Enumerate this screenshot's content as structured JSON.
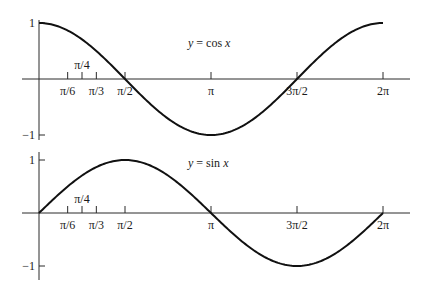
{
  "chart_data": [
    {
      "type": "line",
      "title": "",
      "function": "cos",
      "equation": {
        "y": "y",
        "eq": "=",
        "fn": "cos",
        "x": "x"
      },
      "xlabel": "",
      "ylabel": "",
      "xlim": [
        0,
        6.2832
      ],
      "ylim": [
        -1,
        1
      ],
      "grid": false,
      "x_ticks": [
        {
          "value": 0.5236,
          "label": "π/6",
          "above": false
        },
        {
          "value": 0.7854,
          "label": "π/4",
          "above": true
        },
        {
          "value": 1.0472,
          "label": "π/3",
          "above": false
        },
        {
          "value": 1.5708,
          "label": "π/2",
          "above": false
        },
        {
          "value": 3.1416,
          "label": "π",
          "above": false
        },
        {
          "value": 4.7124,
          "label": "3π/2",
          "above": false
        },
        {
          "value": 6.2832,
          "label": "2π",
          "above": false
        }
      ],
      "y_ticks": [
        {
          "value": 1,
          "label": "1"
        },
        {
          "value": -1,
          "label": "−1"
        }
      ],
      "series": [
        {
          "name": "y = cos x",
          "x_range": [
            0,
            6.2832
          ]
        }
      ]
    },
    {
      "type": "line",
      "title": "",
      "function": "sin",
      "equation": {
        "y": "y",
        "eq": "=",
        "fn": "sin",
        "x": "x"
      },
      "xlabel": "",
      "ylabel": "",
      "xlim": [
        0,
        6.2832
      ],
      "ylim": [
        -1,
        1
      ],
      "grid": false,
      "x_ticks": [
        {
          "value": 0.5236,
          "label": "π/6",
          "above": false
        },
        {
          "value": 0.7854,
          "label": "π/4",
          "above": true
        },
        {
          "value": 1.0472,
          "label": "π/3",
          "above": false
        },
        {
          "value": 1.5708,
          "label": "π/2",
          "above": false
        },
        {
          "value": 3.1416,
          "label": "π",
          "above": false
        },
        {
          "value": 4.7124,
          "label": "3π/2",
          "above": false
        },
        {
          "value": 6.2832,
          "label": "2π",
          "above": false
        }
      ],
      "y_ticks": [
        {
          "value": 1,
          "label": "1"
        },
        {
          "value": -1,
          "label": "−1"
        }
      ],
      "series": [
        {
          "name": "y = sin x",
          "x_range": [
            0,
            6.2832
          ]
        }
      ]
    }
  ]
}
